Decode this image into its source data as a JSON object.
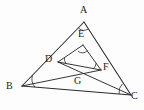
{
  "figure": {
    "type": "geometry-diagram",
    "background_color": "#fdfdfd",
    "stroke_color": "#2a2a2a",
    "label_color": "#1c1c1c",
    "width": 144,
    "height": 110
  },
  "points": {
    "A": {
      "label": "A",
      "x": 84,
      "y": 22,
      "label_x": 80,
      "label_y": 5
    },
    "B": {
      "label": "B",
      "x": 22,
      "y": 86,
      "label_x": 7,
      "label_y": 82
    },
    "C": {
      "label": "C",
      "x": 131,
      "y": 95,
      "label_x": 131,
      "label_y": 91
    },
    "D": {
      "label": "D",
      "x": 58,
      "y": 62,
      "label_x": 45,
      "label_y": 54
    },
    "E": {
      "label": "E",
      "x": 83,
      "y": 45,
      "label_x": 78,
      "label_y": 29
    },
    "F": {
      "label": "F",
      "x": 101,
      "y": 70,
      "label_x": 103,
      "label_y": 62
    },
    "G": {
      "label": "G",
      "x": 79,
      "y": 79,
      "label_x": 74,
      "label_y": 76
    }
  },
  "segments": [
    {
      "name": "AB",
      "from": "A",
      "to": "B",
      "kind": "outer"
    },
    {
      "name": "AC",
      "from": "A",
      "to": "C",
      "kind": "outer"
    },
    {
      "name": "BC",
      "from": "B",
      "to": "C",
      "kind": "outer"
    },
    {
      "name": "DE",
      "from": "D",
      "to": "E",
      "kind": "inner"
    },
    {
      "name": "EF",
      "from": "E",
      "to": "F",
      "kind": "inner"
    },
    {
      "name": "DF",
      "from": "D",
      "to": "F",
      "kind": "inner"
    },
    {
      "name": "DC",
      "from": "D",
      "to": "C",
      "kind": "cevian"
    },
    {
      "name": "BF",
      "from": "B",
      "to": "F",
      "kind": "cevian"
    }
  ],
  "angle_marks": [
    {
      "at": "A",
      "name": "angle-A"
    },
    {
      "at": "B",
      "name": "angle-B"
    },
    {
      "at": "C",
      "name": "angle-C"
    },
    {
      "at": "D",
      "name": "angle-D"
    },
    {
      "at": "E",
      "name": "angle-E"
    },
    {
      "at": "F",
      "name": "angle-F"
    }
  ]
}
